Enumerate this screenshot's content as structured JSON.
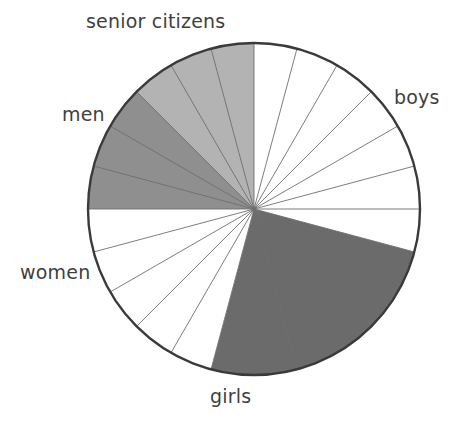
{
  "chart_data": {
    "type": "pie",
    "title": "",
    "xlabel": "",
    "ylabel": "",
    "grid": false,
    "legend_position": "none",
    "start_angle_deg": 0,
    "direction": "clockwise",
    "total_slices": 24,
    "slice_angle_deg": 15,
    "center": {
      "x": 254,
      "y": 209
    },
    "radius": 166,
    "categories": [
      "boys",
      "girls",
      "women",
      "men",
      "senior citizens"
    ],
    "values": [
      7,
      6,
      5,
      3,
      3
    ],
    "percentages": [
      29.2,
      25.0,
      20.8,
      12.5,
      12.5
    ],
    "series": [
      {
        "name": "population groups",
        "values": [
          7,
          6,
          5,
          3,
          3
        ]
      }
    ],
    "slices": [
      {
        "label": "boys",
        "count": 7,
        "start_deg": 0,
        "end_deg": 105,
        "color": "#ffffff"
      },
      {
        "label": "girls",
        "count": 6,
        "start_deg": 105,
        "end_deg": 195,
        "color": "#6b6b6b"
      },
      {
        "label": "women",
        "count": 5,
        "start_deg": 195,
        "end_deg": 270,
        "color": "#ffffff"
      },
      {
        "label": "men",
        "count": 3,
        "start_deg": 270,
        "end_deg": 315,
        "color": "#8f8f8f"
      },
      {
        "label": "senior citizens",
        "count": 3,
        "start_deg": 315,
        "end_deg": 360,
        "color": "#b3b3b3"
      }
    ],
    "annotations": [
      {
        "name": "senior-citizens",
        "text": "senior citizens"
      },
      {
        "name": "boys",
        "text": "boys"
      },
      {
        "name": "men",
        "text": "men"
      },
      {
        "name": "women",
        "text": "women"
      },
      {
        "name": "girls",
        "text": "girls"
      }
    ]
  },
  "labels": {
    "senior_citizens": "senior citizens",
    "boys": "boys",
    "men": "men",
    "women": "women",
    "girls": "girls"
  },
  "colors": {
    "white_slice": "#ffffff",
    "light_gray_slice": "#b3b3b3",
    "medium_gray_slice": "#8f8f8f",
    "dark_gray_slice": "#6b6b6b",
    "outline": "#3a3a3a",
    "divider": "#6e6e6e",
    "label_text": "#3f3f3f",
    "background": "#ffffff"
  }
}
